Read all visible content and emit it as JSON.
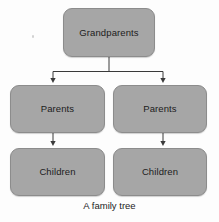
{
  "diagram": {
    "caption": "A family tree",
    "background_color": "#fdfdfd",
    "node_fill_color": "#a6a6a6",
    "node_border_color": "#8c8c8c",
    "text_color": "#1c1c1c",
    "connector_color": "#3a3a3a",
    "nodes": [
      {
        "id": "grandparents",
        "label": "Grandparents",
        "level": 0,
        "column": "center"
      },
      {
        "id": "parents-left",
        "label": "Parents",
        "level": 1,
        "column": "left"
      },
      {
        "id": "parents-right",
        "label": "Parents",
        "level": 1,
        "column": "right"
      },
      {
        "id": "children-left",
        "label": "Children",
        "level": 2,
        "column": "left"
      },
      {
        "id": "children-right",
        "label": "Children",
        "level": 2,
        "column": "right"
      }
    ],
    "edges": [
      {
        "from": "grandparents",
        "to": "parents-left",
        "style": "elbow",
        "arrowhead": true
      },
      {
        "from": "grandparents",
        "to": "parents-right",
        "style": "elbow",
        "arrowhead": true
      },
      {
        "from": "parents-left",
        "to": "children-left",
        "style": "straight",
        "arrowhead": true
      },
      {
        "from": "parents-right",
        "to": "children-right",
        "style": "straight",
        "arrowhead": true
      }
    ]
  }
}
